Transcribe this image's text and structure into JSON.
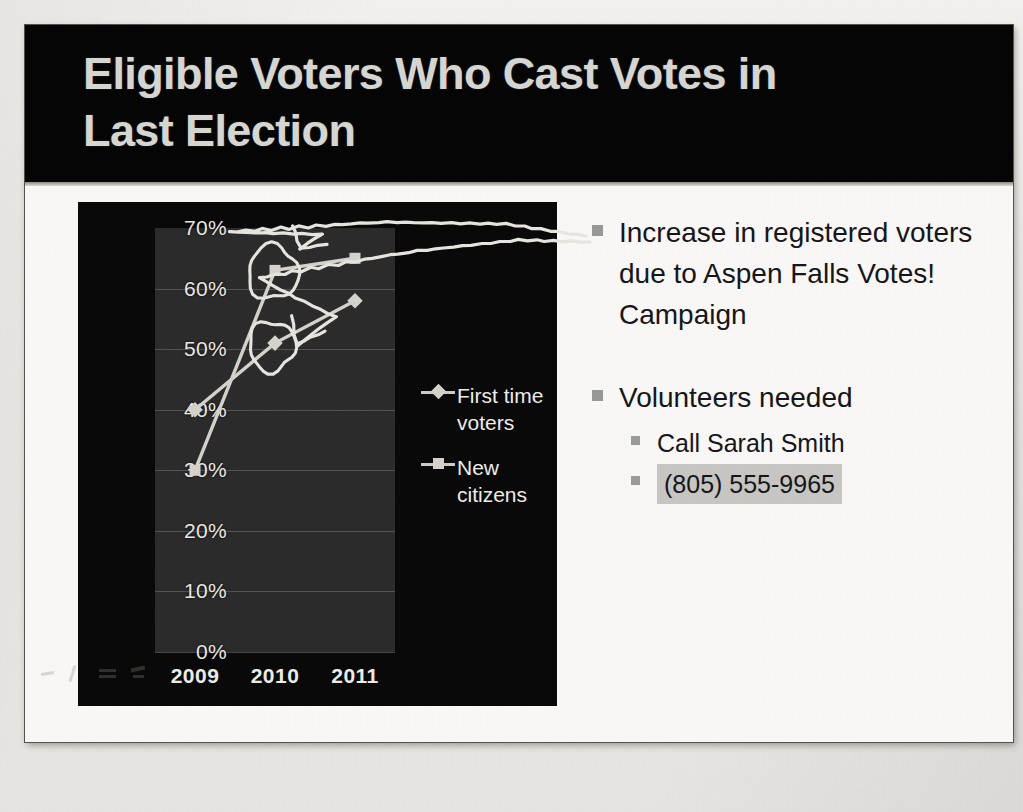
{
  "slide": {
    "title": "Eligible Voters Who Cast Votes in\nLast Election"
  },
  "chart_data": {
    "type": "line",
    "title": "",
    "xlabel": "",
    "ylabel": "",
    "categories": [
      "2009",
      "2010",
      "2011"
    ],
    "ylim": [
      0,
      70
    ],
    "ytick_labels": [
      "0%",
      "10%",
      "20%",
      "30%",
      "40%",
      "50%",
      "60%",
      "70%"
    ],
    "ytick_values": [
      0,
      10,
      20,
      30,
      40,
      50,
      60,
      70
    ],
    "grid": true,
    "legend_position": "right",
    "series": [
      {
        "name": "First time voters",
        "marker": "diamond",
        "color": "#d6d4cd",
        "values": [
          40,
          51,
          58
        ]
      },
      {
        "name": "New citizens",
        "marker": "square",
        "color": "#d6d4cd",
        "values": [
          30,
          63,
          65
        ]
      }
    ]
  },
  "bullets": {
    "items": [
      {
        "level": 1,
        "text": "Increase in registered voters due to Aspen Falls Votes! Campaign",
        "highlight": false
      },
      {
        "level": 1,
        "text": "Volunteers needed",
        "highlight": false
      },
      {
        "level": 2,
        "text": "Call Sarah Smith",
        "highlight": false
      },
      {
        "level": 2,
        "text": "(805) 555-9965",
        "highlight": true
      }
    ]
  },
  "annotations": {
    "ink_color": "#e9e7e1",
    "marks": [
      {
        "name": "circle-around-new-citizens-2010",
        "shape": "ellipse"
      },
      {
        "name": "circle-around-first-time-voters-2010",
        "shape": "ellipse"
      },
      {
        "name": "arrow-from-new-citizens-to-bullet",
        "shape": "arrow"
      },
      {
        "name": "arrow-from-first-time-voters-to-bullet",
        "shape": "arrow"
      }
    ]
  }
}
